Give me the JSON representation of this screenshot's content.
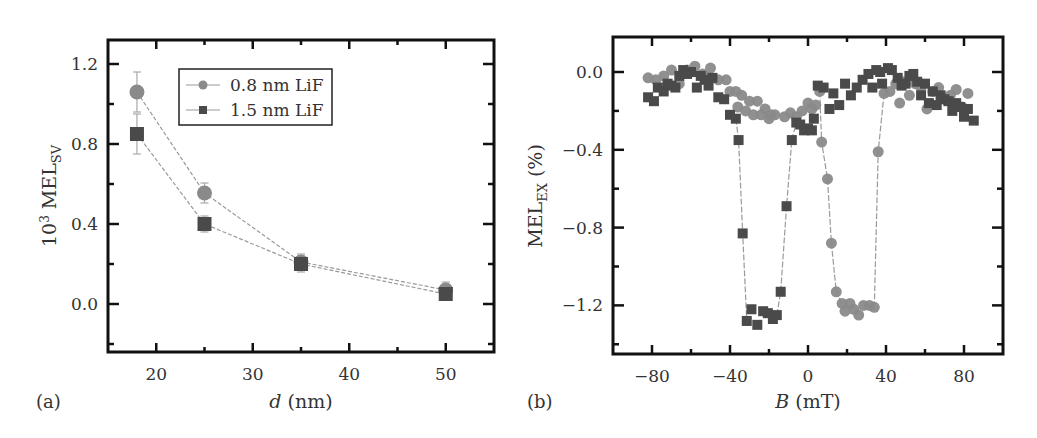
{
  "chart_data": [
    {
      "panel": "(a)",
      "type": "line",
      "title": "",
      "xlabel_italic": "d",
      "xlabel_rest": " (nm)",
      "ylabel_prefix": "10",
      "ylabel_sup": "3",
      "ylabel_main": " MEL",
      "ylabel_sub": "SV",
      "xlim": [
        15,
        55
      ],
      "ylim": [
        -0.24,
        1.32
      ],
      "xticks": [
        20,
        30,
        40,
        50
      ],
      "xtick_labels": [
        "20",
        "30",
        "40",
        "50"
      ],
      "yticks": [
        0.0,
        0.4,
        0.8,
        1.2
      ],
      "ytick_labels": [
        "0.0",
        "0.4",
        "0.8",
        "1.2"
      ],
      "grid": false,
      "legend_position": "upper-center",
      "x": [
        18,
        25,
        35,
        50
      ],
      "series": [
        {
          "name": "0.8 nm LiF",
          "marker": "circle",
          "color": "#8a8a8a",
          "values": [
            1.06,
            0.555,
            0.21,
            0.07
          ],
          "errors": [
            0.1,
            0.05,
            0.04,
            0.04
          ]
        },
        {
          "name": "1.5 nm LiF",
          "marker": "square",
          "color": "#4a4a4a",
          "values": [
            0.85,
            0.4,
            0.2,
            0.05
          ],
          "errors": [
            0.1,
            0.04,
            0.04,
            0.03
          ]
        }
      ]
    },
    {
      "panel": "(b)",
      "type": "scatter",
      "title": "",
      "xlabel_italic": "B",
      "xlabel_rest": " (mT)",
      "ylabel_main": "MEL",
      "ylabel_sub": "EX",
      "ylabel_rest": " (%)",
      "xlim": [
        -100,
        100
      ],
      "ylim": [
        -1.45,
        0.18
      ],
      "xticks": [
        -80,
        -40,
        0,
        40,
        80
      ],
      "xtick_labels": [
        "−80",
        "−40",
        "0",
        "40",
        "80"
      ],
      "yticks": [
        0.0,
        -0.4,
        -0.8,
        -1.2
      ],
      "ytick_labels": [
        "0.0",
        "−0.4",
        "−0.8",
        "−1.2"
      ],
      "grid": false,
      "series": [
        {
          "name": "circles",
          "marker": "circle",
          "color": "#8a8a8a",
          "points": [
            [
              -82,
              -0.03
            ],
            [
              -78,
              -0.04
            ],
            [
              -74,
              -0.02
            ],
            [
              -70,
              0.01
            ],
            [
              -66,
              -0.06
            ],
            [
              -62,
              0.01
            ],
            [
              -58,
              0.03
            ],
            [
              -54,
              -0.01
            ],
            [
              -50,
              0.02
            ],
            [
              -46,
              -0.04
            ],
            [
              -42,
              -0.04
            ],
            [
              -40,
              -0.1
            ],
            [
              -37,
              -0.1
            ],
            [
              -34,
              -0.12
            ],
            [
              -30,
              -0.15
            ],
            [
              -26,
              -0.15
            ],
            [
              -22,
              -0.19
            ],
            [
              -19,
              -0.22
            ],
            [
              -17,
              -0.22
            ],
            [
              -36,
              -0.18
            ],
            [
              -32,
              -0.2
            ],
            [
              -28,
              -0.22
            ],
            [
              -24,
              -0.22
            ],
            [
              -20,
              -0.24
            ],
            [
              -12,
              -0.23
            ],
            [
              -9,
              -0.21
            ],
            [
              -6,
              -0.23
            ],
            [
              -3,
              -0.2
            ],
            [
              0,
              -0.16
            ],
            [
              2,
              -0.19
            ],
            [
              4,
              -0.17
            ],
            [
              6,
              -0.1
            ],
            [
              7,
              -0.36
            ],
            [
              10,
              -0.55
            ],
            [
              12,
              -0.88
            ],
            [
              14.5,
              -1.13
            ],
            [
              17.5,
              -1.19
            ],
            [
              19,
              -1.23
            ],
            [
              21.5,
              -1.19
            ],
            [
              23.5,
              -1.22
            ],
            [
              26,
              -1.25
            ],
            [
              28.5,
              -1.2
            ],
            [
              31.5,
              -1.2
            ],
            [
              34,
              -1.21
            ],
            [
              36,
              -0.41
            ],
            [
              39,
              -0.11
            ],
            [
              42,
              -0.1
            ],
            [
              45,
              -0.06
            ],
            [
              47,
              -0.16
            ],
            [
              49,
              -0.05
            ],
            [
              52,
              -0.12
            ],
            [
              55,
              -0.06
            ],
            [
              58,
              -0.08
            ],
            [
              61,
              -0.19
            ],
            [
              64,
              -0.1
            ],
            [
              67,
              -0.08
            ],
            [
              70,
              -0.14
            ],
            [
              73,
              -0.12
            ],
            [
              76,
              -0.09
            ],
            [
              79,
              -0.18
            ],
            [
              82,
              -0.11
            ]
          ]
        },
        {
          "name": "squares",
          "marker": "square",
          "color": "#4a4a4a",
          "points": [
            [
              -82,
              -0.13
            ],
            [
              -79,
              -0.15
            ],
            [
              -77,
              -0.08
            ],
            [
              -74,
              -0.1
            ],
            [
              -72,
              -0.06
            ],
            [
              -70,
              -0.07
            ],
            [
              -68,
              -0.08
            ],
            [
              -66,
              -0.02
            ],
            [
              -64,
              0.01
            ],
            [
              -62,
              -0.01
            ],
            [
              -60,
              0.0
            ],
            [
              -57,
              -0.08
            ],
            [
              -55,
              -0.02
            ],
            [
              -53,
              -0.04
            ],
            [
              -51,
              -0.07
            ],
            [
              -49,
              -0.03
            ],
            [
              -46,
              -0.13
            ],
            [
              -43,
              -0.14
            ],
            [
              -40,
              -0.22
            ],
            [
              -37,
              -0.24
            ],
            [
              -35.6,
              -0.35
            ],
            [
              -33.5,
              -0.83
            ],
            [
              -31.4,
              -1.28
            ],
            [
              -29,
              -1.22
            ],
            [
              -26,
              -1.3
            ],
            [
              -23,
              -1.23
            ],
            [
              -20.6,
              -1.24
            ],
            [
              -18,
              -1.27
            ],
            [
              -16,
              -1.25
            ],
            [
              -14,
              -1.13
            ],
            [
              -11,
              -0.69
            ],
            [
              -8.3,
              -0.35
            ],
            [
              -6,
              -0.26
            ],
            [
              -4,
              -0.27
            ],
            [
              -2,
              -0.3
            ],
            [
              0,
              -0.29
            ],
            [
              2,
              -0.3
            ],
            [
              3,
              -0.24
            ],
            [
              5,
              -0.07
            ],
            [
              8,
              -0.08
            ],
            [
              11,
              -0.19
            ],
            [
              13,
              -0.11
            ],
            [
              16,
              -0.17
            ],
            [
              19,
              -0.06
            ],
            [
              22,
              -0.12
            ],
            [
              25,
              -0.08
            ],
            [
              28,
              -0.04
            ],
            [
              31,
              -0.01
            ],
            [
              33,
              -0.08
            ],
            [
              35,
              0.01
            ],
            [
              37,
              0.0
            ],
            [
              38,
              -0.06
            ],
            [
              41,
              0.02
            ],
            [
              43,
              0.01
            ],
            [
              46,
              -0.03
            ],
            [
              48,
              -0.07
            ],
            [
              50,
              -0.06
            ],
            [
              52,
              -0.02
            ],
            [
              54,
              -0.01
            ],
            [
              56,
              -0.05
            ],
            [
              58,
              -0.12
            ],
            [
              60,
              -0.06
            ],
            [
              62,
              -0.16
            ],
            [
              64,
              -0.1
            ],
            [
              66,
              -0.17
            ],
            [
              68,
              -0.12
            ],
            [
              70,
              -0.14
            ],
            [
              72,
              -0.15
            ],
            [
              74,
              -0.2
            ],
            [
              76,
              -0.16
            ],
            [
              78,
              -0.18
            ],
            [
              80,
              -0.23
            ],
            [
              82,
              -0.19
            ],
            [
              85,
              -0.25
            ]
          ]
        }
      ],
      "connecting_lines": {
        "squares_dip": [
          [
            -37,
            -0.24
          ],
          [
            -35.6,
            -0.35
          ],
          [
            -33.5,
            -0.83
          ],
          [
            -31.4,
            -1.28
          ]
        ],
        "squares_rise": [
          [
            -16,
            -1.25
          ],
          [
            -14,
            -1.13
          ],
          [
            -11,
            -0.69
          ],
          [
            -8.3,
            -0.35
          ],
          [
            -6,
            -0.26
          ]
        ],
        "circles_dip": [
          [
            6,
            -0.1
          ],
          [
            7,
            -0.36
          ],
          [
            10,
            -0.55
          ],
          [
            12,
            -0.88
          ],
          [
            14.5,
            -1.13
          ],
          [
            17.5,
            -1.19
          ]
        ],
        "circles_rise": [
          [
            34,
            -1.21
          ],
          [
            36,
            -0.41
          ],
          [
            39,
            -0.11
          ]
        ]
      }
    }
  ],
  "panels": {
    "a": {
      "label": "(a)"
    },
    "b": {
      "label": "(b)"
    }
  },
  "legend": {
    "items": [
      {
        "label": "0.8 nm LiF"
      },
      {
        "label": "1.5 nm LiF"
      }
    ]
  }
}
